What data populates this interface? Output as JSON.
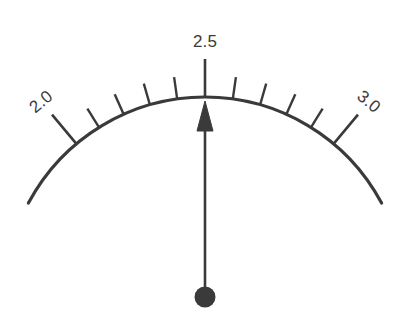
{
  "gauge": {
    "title": "",
    "unit": "",
    "scale_min": 2.0,
    "scale_max": 3.0,
    "needle_value": 2.5,
    "stroke_color": "#3a3a3a",
    "background_color": "#ffffff",
    "labels": [
      {
        "text": "2.0",
        "value": 2.0,
        "rotated": true
      },
      {
        "text": "2.5",
        "value": 2.5,
        "rotated": false
      },
      {
        "text": "3.0",
        "value": 3.0,
        "rotated": true
      }
    ],
    "major_ticks": [
      {
        "value": 2.0
      },
      {
        "value": 2.5
      },
      {
        "value": 3.0
      }
    ],
    "minor_ticks": [
      {
        "value": 2.1
      },
      {
        "value": 2.2
      },
      {
        "value": 2.3
      },
      {
        "value": 2.4
      },
      {
        "value": 2.6
      },
      {
        "value": 2.7
      },
      {
        "value": 2.8
      },
      {
        "value": 2.9
      }
    ]
  },
  "chart_data": {
    "type": "gauge",
    "title": "",
    "xlabel": "",
    "ylabel": "",
    "axis_range": [
      2.0,
      3.0
    ],
    "tick_interval": 0.1,
    "major_tick_interval": 0.5,
    "tick_labels": [
      "2.0",
      "2.5",
      "3.0"
    ],
    "tick_label_values": [
      2.0,
      2.5,
      3.0
    ],
    "minor_tick_values": [
      2.1,
      2.2,
      2.3,
      2.4,
      2.6,
      2.7,
      2.8,
      2.9
    ],
    "values": [
      2.5
    ],
    "series": [
      {
        "name": "needle",
        "values": [
          2.5
        ]
      }
    ],
    "annotations": [],
    "legend": "none",
    "grid": false
  }
}
